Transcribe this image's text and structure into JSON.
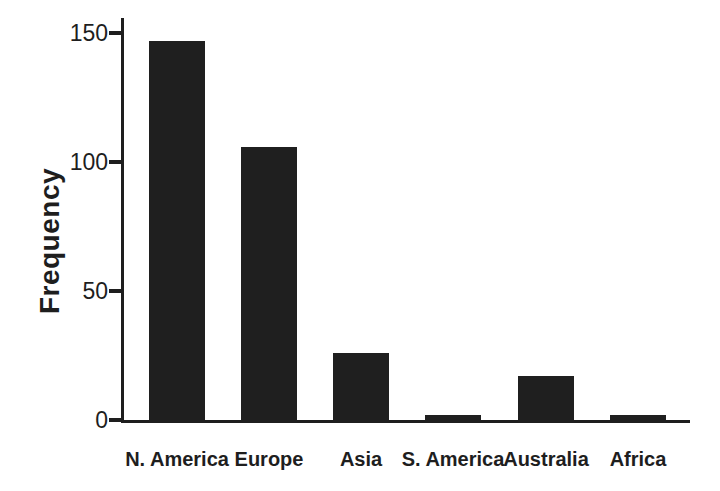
{
  "figure": {
    "background_color": "#ffffff",
    "ink_color": "#1e1e1e",
    "bar_color": "#1f1f1f"
  },
  "chart_data": {
    "type": "bar",
    "title": "",
    "categories": [
      "N. America",
      "Europe",
      "Asia",
      "S. America",
      "Australia",
      "Africa"
    ],
    "values": [
      147,
      106,
      26,
      2,
      17,
      2
    ],
    "xlabel": "",
    "ylabel": "Frequency",
    "ylim": [
      0,
      150
    ],
    "yticks": [
      0,
      50,
      100,
      150
    ],
    "grid": false,
    "legend": "none",
    "bar_fill": "solid-dark"
  }
}
